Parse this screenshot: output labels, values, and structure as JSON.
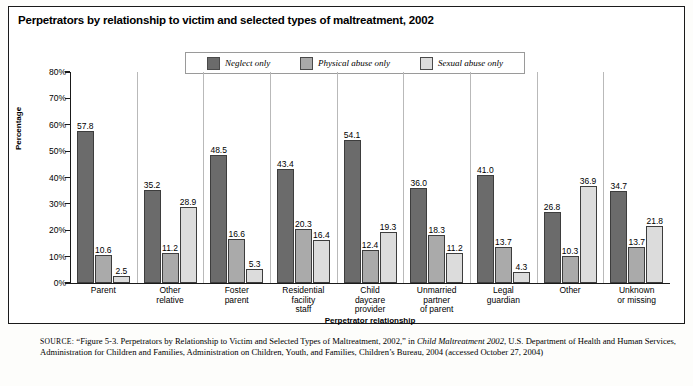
{
  "figure": {
    "title": "Perpetrators by relationship to victim and selected types of maltreatment, 2002",
    "source_keyword": "SOURCE:",
    "source_part1": " “Figure 5-3. Perpetrators by Relationship to Victim and Selected Types of Maltreatment, 2002,” in ",
    "source_italic": "Child Maltreatment 2002",
    "source_part2": ", U.S. Department of Health and Human Services, Administration for Children and Families, Administration on Children, Youth, and Families, Children’s Bureau, 2004 (accessed October 27, 2004)"
  },
  "colors": {
    "series_neglect": "#6b6b6b",
    "series_physical": "#aaaaaa",
    "series_sexual": "#dcdcdc",
    "axis": "#1a1a1a",
    "frame": "#1a1a1a"
  },
  "chart_data": {
    "type": "bar",
    "title": "Perpetrators by relationship to victim and selected types of maltreatment, 2002",
    "xlabel": "Perpetrator relationship",
    "ylabel": "Percentage",
    "ylim": [
      0,
      80
    ],
    "ytick_labels": [
      "0%",
      "10%",
      "20%",
      "30%",
      "40%",
      "50%",
      "60%",
      "70%",
      "80%"
    ],
    "ytick_values": [
      0,
      10,
      20,
      30,
      40,
      50,
      60,
      70,
      80
    ],
    "grid": false,
    "legend_position": "top-center",
    "categories": [
      "Parent",
      "Other relative",
      "Foster parent",
      "Residential facility staff",
      "Child daycare provider",
      "Unmarried partner of parent",
      "Legal guardian",
      "Other",
      "Unknown or missing"
    ],
    "category_lines": [
      [
        "Parent"
      ],
      [
        "Other",
        "relative"
      ],
      [
        "Foster",
        "parent"
      ],
      [
        "Residential",
        "facility",
        "staff"
      ],
      [
        "Child",
        "daycare",
        "provider"
      ],
      [
        "Unmarried",
        "partner",
        "of parent"
      ],
      [
        "Legal",
        "guardian"
      ],
      [
        "Other"
      ],
      [
        "Unknown",
        "or missing"
      ]
    ],
    "series": [
      {
        "name": "Neglect only",
        "values": [
          57.8,
          35.2,
          48.5,
          43.4,
          54.1,
          36.0,
          41.0,
          26.8,
          34.7
        ]
      },
      {
        "name": "Physical abuse only",
        "values": [
          10.6,
          11.2,
          16.6,
          20.3,
          12.4,
          18.3,
          13.7,
          10.3,
          13.7
        ]
      },
      {
        "name": "Sexual abuse only",
        "values": [
          2.5,
          28.9,
          5.3,
          16.4,
          19.3,
          11.2,
          4.3,
          36.9,
          21.8
        ]
      }
    ]
  }
}
